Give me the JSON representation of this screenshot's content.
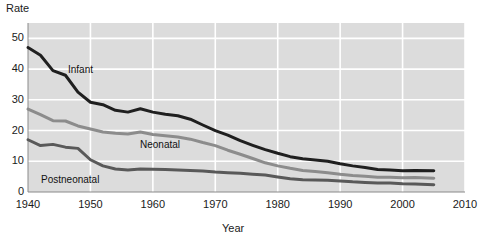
{
  "chart_data": {
    "type": "line",
    "title": "",
    "xlabel": "Year",
    "ylabel": "Rate",
    "xlim": [
      1940,
      2010
    ],
    "ylim": [
      0,
      55
    ],
    "xticks": [
      1940,
      1950,
      1960,
      1970,
      1980,
      1990,
      2000,
      2010
    ],
    "yticks": [
      0,
      10,
      20,
      30,
      40,
      50
    ],
    "grid": true,
    "legend_position": "inline-labels",
    "x": [
      1940,
      1942,
      1944,
      1946,
      1948,
      1950,
      1952,
      1954,
      1956,
      1958,
      1960,
      1962,
      1964,
      1966,
      1968,
      1970,
      1972,
      1974,
      1976,
      1978,
      1980,
      1982,
      1984,
      1986,
      1988,
      1990,
      1992,
      1994,
      1996,
      1998,
      2000,
      2002,
      2005
    ],
    "series": [
      {
        "name": "Infant",
        "color": "#1f1f1f",
        "values": [
          47.0,
          44.5,
          39.5,
          38.0,
          32.5,
          29.2,
          28.4,
          26.6,
          26.0,
          27.1,
          26.0,
          25.3,
          24.8,
          23.7,
          21.8,
          20.0,
          18.5,
          16.7,
          15.2,
          13.8,
          12.6,
          11.5,
          10.8,
          10.4,
          10.0,
          9.2,
          8.5,
          8.0,
          7.3,
          7.2,
          6.9,
          7.0,
          6.9
        ]
      },
      {
        "name": "Neonatal",
        "color": "#8c8c8c",
        "values": [
          27.0,
          25.2,
          23.2,
          23.1,
          21.5,
          20.5,
          19.5,
          19.1,
          18.9,
          19.5,
          18.7,
          18.3,
          17.9,
          17.2,
          16.1,
          15.1,
          13.6,
          12.3,
          10.9,
          9.5,
          8.5,
          7.7,
          7.0,
          6.7,
          6.3,
          5.8,
          5.4,
          5.1,
          4.8,
          4.8,
          4.6,
          4.7,
          4.5
        ]
      },
      {
        "name": "Postneonatal",
        "color": "#595959",
        "values": [
          17.0,
          15.1,
          15.5,
          14.6,
          14.2,
          10.5,
          8.5,
          7.5,
          7.2,
          7.5,
          7.4,
          7.3,
          7.2,
          7.0,
          6.8,
          6.5,
          6.3,
          6.1,
          5.8,
          5.5,
          4.9,
          4.3,
          4.0,
          3.9,
          3.8,
          3.6,
          3.3,
          3.1,
          2.9,
          2.9,
          2.7,
          2.6,
          2.4
        ]
      }
    ]
  },
  "axes": {
    "y_title": "Rate",
    "x_title": "Year",
    "y_tick_labels": [
      "50",
      "40",
      "30",
      "20",
      "10",
      "0"
    ],
    "x_tick_labels": [
      "1940",
      "1950",
      "1960",
      "1970",
      "1980",
      "1990",
      "2000",
      "2010"
    ]
  },
  "labels": {
    "infant": "Infant",
    "neonatal": "Neonatal",
    "postneonatal": "Postneonatal"
  },
  "colors": {
    "plot_background": "#dcdcdc",
    "gridline": "#ffffff",
    "axis_line": "#8a8a8a",
    "infant": "#1f1f1f",
    "neonatal": "#8c8c8c",
    "postneonatal": "#595959",
    "text": "#1a1a1a"
  }
}
